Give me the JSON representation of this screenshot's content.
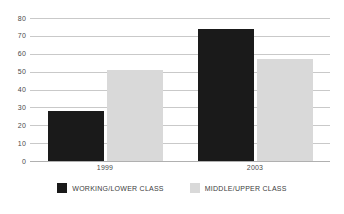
{
  "chart_data": {
    "type": "bar",
    "title": "",
    "subtitle": "",
    "xlabel": "",
    "ylabel": "",
    "categories": [
      "1999",
      "2003"
    ],
    "series": [
      {
        "name": "WORKING/LOWER CLASS",
        "color": "#1a1a1a",
        "values": [
          28,
          74
        ]
      },
      {
        "name": "MIDDLE/UPPER CLASS",
        "color": "#d9d9d9",
        "values": [
          51,
          57
        ]
      }
    ],
    "ylim": [
      0,
      80
    ],
    "yticks": [
      0,
      10,
      20,
      30,
      40,
      50,
      60,
      70,
      80
    ],
    "ytick_labels": [
      "0",
      "10",
      "20",
      "30",
      "40",
      "50",
      "60",
      "70",
      "80"
    ],
    "grid": true,
    "grid_color": "#c9c9c9",
    "legend_position": "bottom",
    "background": "#ffffff"
  }
}
